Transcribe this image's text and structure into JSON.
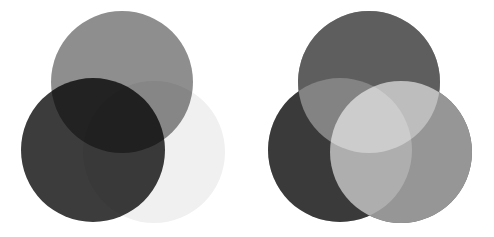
{
  "figure": {
    "background": "#ffffff",
    "width": 494,
    "height": 237
  },
  "chart_data": {
    "type": "diagram",
    "subtitle": "",
    "xlabel": "",
    "ylabel": "",
    "grid": false,
    "legend": "none",
    "annotations": [],
    "panels": [
      {
        "name": "subtractive",
        "label": "",
        "blend": "multiply",
        "description": "Three overlapping discs that darken where they overlap; the three-way overlap is nearly black.",
        "circles": [
          {
            "name": "top",
            "cx": 122,
            "cy": 82,
            "r": 71,
            "fill": "#8e8e8e",
            "opacity": 1
          },
          {
            "name": "bottom-left",
            "cx": 93,
            "cy": 150,
            "r": 72,
            "fill": "#3c3c3c",
            "opacity": 1
          },
          {
            "name": "bottom-right",
            "cx": 154,
            "cy": 152,
            "r": 71,
            "fill": "#f0f0f0",
            "opacity": 1
          }
        ],
        "overlap_values": {
          "top_only": "#8e8e8e",
          "bottom_left_only": "#3c3c3c",
          "bottom_right_only": "#f0f0f0",
          "top_and_bottom_left": "#222222",
          "top_and_bottom_right": "#797979",
          "bottom_left_and_bottom_right": "#343434",
          "all_three": "#0e0e0e"
        }
      },
      {
        "name": "additive",
        "label": "",
        "blend": "screen",
        "description": "Three overlapping discs that lighten where they overlap; the three-way overlap is pure white.",
        "circles": [
          {
            "name": "top",
            "cx": 369,
            "cy": 82,
            "r": 71,
            "fill": "#5e5e5e",
            "opacity": 1
          },
          {
            "name": "bottom-left",
            "cx": 340,
            "cy": 150,
            "r": 72,
            "fill": "#3a3a3a",
            "opacity": 1
          },
          {
            "name": "bottom-right",
            "cx": 401,
            "cy": 152,
            "r": 71,
            "fill": "#969696",
            "opacity": 1
          }
        ],
        "overlap_values": {
          "top_only": "#5e5e5e",
          "bottom_left_only": "#3a3a3a",
          "bottom_right_only": "#969696",
          "top_and_bottom_left": "#808080",
          "top_and_bottom_right": "#d4d4d4",
          "bottom_left_and_bottom_right": "#b4b4b4",
          "all_three": "#ffffff"
        }
      }
    ]
  }
}
